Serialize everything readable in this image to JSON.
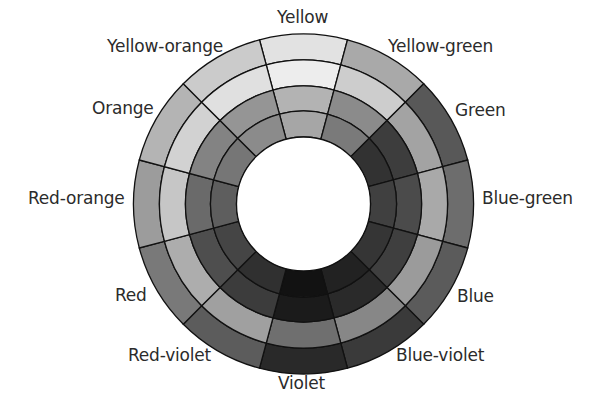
{
  "figure": {
    "type": "color-wheel-diagram",
    "center": {
      "x": 303.5,
      "y": 204
    },
    "ring_radii": [
      170,
      144,
      118,
      93,
      67
    ],
    "segment_angle_deg": 30,
    "segments": [
      {
        "name": "Yellow",
        "angle": 90,
        "label": "Yellow",
        "label_pos": {
          "x": 277,
          "y": 9
        },
        "shades": [
          "#e2e2e2",
          "#ededed",
          "#b3b3b3",
          "#a6a6a6"
        ]
      },
      {
        "name": "Yellow-green",
        "angle": 60,
        "label": "Yellow-green",
        "label_pos": {
          "x": 388,
          "y": 38
        },
        "shades": [
          "#a9a9a9",
          "#cdcdcd",
          "#8b8b8b",
          "#7a7a7a"
        ]
      },
      {
        "name": "Green",
        "angle": 30,
        "label": "Green",
        "label_pos": {
          "x": 455,
          "y": 102
        },
        "shades": [
          "#585858",
          "#a3a3a3",
          "#3d3d3d",
          "#323232"
        ]
      },
      {
        "name": "Blue-green",
        "angle": 0,
        "label": "Blue-green",
        "label_pos": {
          "x": 482,
          "y": 190
        },
        "shades": [
          "#6d6d6d",
          "#a9a9a9",
          "#4b4b4b",
          "#404040"
        ]
      },
      {
        "name": "Blue",
        "angle": -30,
        "label": "Blue",
        "label_pos": {
          "x": 457,
          "y": 288
        },
        "shades": [
          "#5b5b5b",
          "#9b9b9b",
          "#3f3f3f",
          "#353535"
        ]
      },
      {
        "name": "Blue-violet",
        "angle": -60,
        "label": "Blue-violet",
        "label_pos": {
          "x": 396,
          "y": 347
        },
        "shades": [
          "#3a3a3a",
          "#878787",
          "#2a2a2a",
          "#222222"
        ]
      },
      {
        "name": "Violet",
        "angle": -90,
        "label": "Violet",
        "label_pos": {
          "x": 278,
          "y": 375
        },
        "shades": [
          "#292929",
          "#6f6f6f",
          "#1b1b1b",
          "#121212"
        ]
      },
      {
        "name": "Red-violet",
        "angle": -120,
        "label": "Red-violet",
        "label_pos": {
          "x": 128,
          "y": 347
        },
        "shades": [
          "#5c5c5c",
          "#a0a0a0",
          "#3c3c3c",
          "#303030"
        ]
      },
      {
        "name": "Red",
        "angle": -150,
        "label": "Red",
        "label_pos": {
          "x": 115,
          "y": 287
        },
        "shades": [
          "#797979",
          "#adadad",
          "#4e4e4e",
          "#454545"
        ]
      },
      {
        "name": "Red-orange",
        "angle": 180,
        "label": "Red-orange",
        "label_pos": {
          "x": 28,
          "y": 190
        },
        "shades": [
          "#9c9c9c",
          "#c6c6c6",
          "#6a6a6a",
          "#5e5e5e"
        ]
      },
      {
        "name": "Orange",
        "angle": 150,
        "label": "Orange",
        "label_pos": {
          "x": 92,
          "y": 100
        },
        "shades": [
          "#b4b4b4",
          "#d2d2d2",
          "#838383",
          "#767676"
        ]
      },
      {
        "name": "Yellow-orange",
        "angle": 120,
        "label": "Yellow-orange",
        "label_pos": {
          "x": 107,
          "y": 38
        },
        "shades": [
          "#cbcbcb",
          "#e0e0e0",
          "#959595",
          "#8b8b8b"
        ]
      }
    ],
    "labels": {
      "yellow": "Yellow",
      "yellow_green": "Yellow-green",
      "green": "Green",
      "blue_green": "Blue-green",
      "blue": "Blue",
      "blue_violet": "Blue-violet",
      "violet": "Violet",
      "red_violet": "Red-violet",
      "red": "Red",
      "red_orange": "Red-orange",
      "orange": "Orange",
      "yellow_orange": "Yellow-orange"
    },
    "colors": {
      "outline": "#111111",
      "label_text": "#2b2b2b",
      "background": "#ffffff",
      "hole": "#ffffff"
    }
  }
}
